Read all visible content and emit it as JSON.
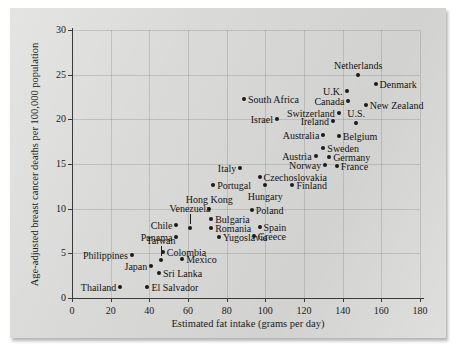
{
  "chart_data": {
    "type": "scatter",
    "title": "",
    "xlabel": "Estimated fat intake (grams per day)",
    "ylabel": "Age-adjusted breast cancer deaths per 100,000 population",
    "xlim": [
      0,
      180
    ],
    "ylim": [
      0,
      30
    ],
    "xticks": [
      0,
      20,
      40,
      60,
      80,
      100,
      120,
      140,
      160,
      180
    ],
    "yticks": [
      0,
      5,
      10,
      15,
      20,
      25,
      30
    ],
    "grid": true,
    "legend": "none",
    "points": [
      {
        "label": "Netherlands",
        "x": 148,
        "y": 25.0,
        "label_pos": "above"
      },
      {
        "label": "Denmark",
        "x": 157,
        "y": 24.0,
        "label_pos": "right"
      },
      {
        "label": "U.K.",
        "x": 142,
        "y": 23.2,
        "label_pos": "left"
      },
      {
        "label": "Canada",
        "x": 143,
        "y": 22.0,
        "label_pos": "left"
      },
      {
        "label": "New Zealand",
        "x": 152,
        "y": 21.6,
        "label_pos": "right"
      },
      {
        "label": "Switzerland",
        "x": 138,
        "y": 20.7,
        "label_pos": "left"
      },
      {
        "label": "Ireland",
        "x": 135,
        "y": 19.8,
        "label_pos": "left"
      },
      {
        "label": "U.S.",
        "x": 147,
        "y": 19.6,
        "label_pos": "above"
      },
      {
        "label": "Belgium",
        "x": 138,
        "y": 18.1,
        "label_pos": "right"
      },
      {
        "label": "Australia",
        "x": 130,
        "y": 18.2,
        "label_pos": "left"
      },
      {
        "label": "Sweden",
        "x": 130,
        "y": 16.8,
        "label_pos": "right"
      },
      {
        "label": "Germany",
        "x": 133,
        "y": 15.8,
        "label_pos": "right"
      },
      {
        "label": "Austria",
        "x": 126,
        "y": 15.9,
        "label_pos": "left"
      },
      {
        "label": "Norway",
        "x": 131,
        "y": 14.9,
        "label_pos": "left"
      },
      {
        "label": "France",
        "x": 137,
        "y": 14.8,
        "label_pos": "right"
      },
      {
        "label": "South Africa",
        "x": 89,
        "y": 22.3,
        "label_pos": "right"
      },
      {
        "label": "Israel",
        "x": 106,
        "y": 20.0,
        "label_pos": "left"
      },
      {
        "label": "Italy",
        "x": 87,
        "y": 14.6,
        "label_pos": "left"
      },
      {
        "label": "Czechoslovakia",
        "x": 97,
        "y": 13.5,
        "label_pos": "right"
      },
      {
        "label": "Finland",
        "x": 114,
        "y": 12.7,
        "label_pos": "right"
      },
      {
        "label": "Portugal",
        "x": 73,
        "y": 12.7,
        "label_pos": "right"
      },
      {
        "label": "Hungary",
        "x": 100,
        "y": 12.6,
        "label_pos": "below"
      },
      {
        "label": "Hong Kong",
        "x": 71,
        "y": 10.0,
        "label_pos": "above"
      },
      {
        "label": "Poland",
        "x": 93,
        "y": 9.9,
        "label_pos": "right"
      },
      {
        "label": "Bulgaria",
        "x": 72,
        "y": 8.8,
        "label_pos": "right"
      },
      {
        "label": "Venezuela",
        "x": 61,
        "y": 7.8,
        "label_pos": "leader-above"
      },
      {
        "label": "Chile",
        "x": 54,
        "y": 8.2,
        "label_pos": "left"
      },
      {
        "label": "Romania",
        "x": 72,
        "y": 7.8,
        "label_pos": "right"
      },
      {
        "label": "Spain",
        "x": 97,
        "y": 7.9,
        "label_pos": "right"
      },
      {
        "label": "Yugoslavia",
        "x": 76,
        "y": 6.8,
        "label_pos": "right"
      },
      {
        "label": "Greece",
        "x": 94,
        "y": 6.9,
        "label_pos": "right"
      },
      {
        "label": "Panama",
        "x": 54,
        "y": 6.8,
        "label_pos": "left"
      },
      {
        "label": "Colombia",
        "x": 47,
        "y": 5.1,
        "label_pos": "right"
      },
      {
        "label": "Philippines",
        "x": 31,
        "y": 4.8,
        "label_pos": "left"
      },
      {
        "label": "Taiwan",
        "x": 46,
        "y": 4.2,
        "label_pos": "leader-above"
      },
      {
        "label": "Mexico",
        "x": 57,
        "y": 4.4,
        "label_pos": "right"
      },
      {
        "label": "Japan",
        "x": 41,
        "y": 3.6,
        "label_pos": "left"
      },
      {
        "label": "Sri Lanka",
        "x": 45,
        "y": 2.8,
        "label_pos": "right"
      },
      {
        "label": "El Salvador",
        "x": 39,
        "y": 1.2,
        "label_pos": "right"
      },
      {
        "label": "Thailand",
        "x": 25,
        "y": 1.2,
        "label_pos": "left"
      }
    ]
  }
}
